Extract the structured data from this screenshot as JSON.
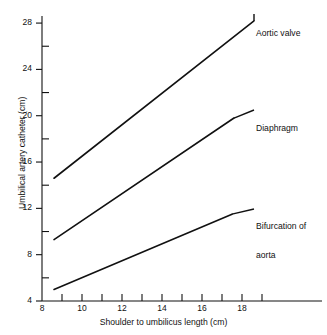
{
  "chart_data": {
    "type": "line",
    "title": "",
    "xlabel": "Shoulder to umbilicus length (cm)",
    "ylabel": "Umbilical artery catheter (cm)",
    "xlim": [
      8,
      19.5
    ],
    "ylim": [
      4,
      28.5
    ],
    "x_major_ticks": [
      8,
      10,
      12,
      14,
      16,
      18
    ],
    "x_minor_ticks": [
      9,
      11,
      13,
      15,
      17,
      19
    ],
    "x_tick_labels": [
      "8",
      "10",
      "12",
      "14",
      "16",
      "18"
    ],
    "y_major_ticks": [
      4,
      8,
      12,
      16,
      20,
      24,
      28
    ],
    "y_minor_ticks": [
      6,
      10,
      14,
      18,
      22,
      26
    ],
    "y_tick_labels": [
      "4",
      "8",
      "12",
      "16",
      "20",
      "24",
      "28"
    ],
    "grid": false,
    "legend_position": "inline-right-of-line-ends",
    "line_color": "#111111",
    "series": [
      {
        "name": "Aortic valve",
        "label_line1": "Aortic valve",
        "label_line2": "",
        "x": [
          8.6,
          18.6
        ],
        "y": [
          14.6,
          28.2
        ]
      },
      {
        "name": "Diaphragm",
        "label_line1": "Diaphragm",
        "label_line2": "",
        "x": [
          8.6,
          17.6
        ],
        "y": [
          9.3,
          19.8
        ]
      },
      {
        "name": "Bifurcation of aorta",
        "label_line1": "Bifurcation of",
        "label_line2": "aorta",
        "x": [
          8.6,
          17.5
        ],
        "y": [
          5.0,
          11.5
        ]
      }
    ]
  }
}
